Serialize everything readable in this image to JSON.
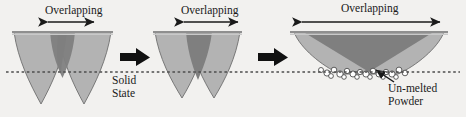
{
  "figure": {
    "background_color": "#f2f1ef",
    "width": 466,
    "height": 117
  },
  "colors": {
    "pool_light": "#b3b3b3",
    "pool_overlap_dark": "#7f7f7f",
    "pool_outline": "#6e6e6e",
    "top_surface": "#9a9a9a",
    "solid_line": "#555555",
    "arrow_black": "#111111",
    "powder_fill": "#ffffff",
    "powder_outline": "#3c3c3c",
    "text": "#1a1a1a"
  },
  "labels": {
    "overlapping_1": "Overlapping",
    "overlapping_2": "Overlapping",
    "overlapping_3": "Overlapping",
    "solid_state": "Solid\nState",
    "solid_state_line1": "Solid",
    "solid_state_line2": "State",
    "unmelted_powder_line1": "Un-melted",
    "unmelted_powder_line2": "Powder"
  },
  "stages": [
    {
      "index": 1,
      "name": "stage-low-overlap",
      "description": "Two deep U-shaped melt pools with small overlap region",
      "overlap_label": "Overlapping",
      "overlap_span_px": 60,
      "powder_present": false
    },
    {
      "index": 2,
      "name": "stage-medium-overlap",
      "description": "Two melt pools with increased overlap region",
      "overlap_label": "Overlapping",
      "overlap_span_px": 72,
      "powder_present": false
    },
    {
      "index": 3,
      "name": "stage-high-overlap",
      "description": "Fully merged shallow wide melt pool with un-melted powder trapped at the bottom",
      "overlap_label": "Overlapping",
      "overlap_span_px": 140,
      "powder_present": true
    }
  ],
  "transitions": [
    {
      "name": "transition-arrow-1",
      "symbol": "right-block-arrow"
    },
    {
      "name": "transition-arrow-2",
      "symbol": "right-block-arrow"
    }
  ],
  "annotations": {
    "solid_state_dashed_line": "dashed horizontal baseline indicating solid state boundary",
    "powder_callout": "arrow pointing from Un-melted Powder text to powder particles"
  }
}
